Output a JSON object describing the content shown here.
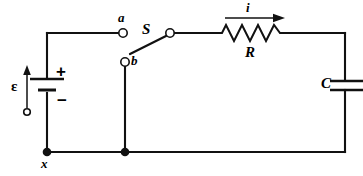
{
  "diagram": {
    "type": "schematic",
    "stroke_color": "#111111",
    "background_color": "#ffffff"
  },
  "labels": {
    "emf": "ε",
    "battery_positive": "+",
    "battery_negative": "−",
    "switch": "S",
    "terminal_a": "a",
    "terminal_b": "b",
    "resistor": "R",
    "current": "i",
    "capacitor": "C",
    "node_x": "x"
  },
  "components": [
    {
      "name": "battery",
      "symbol": "emf-source",
      "label": "ε",
      "polarity_top": "+",
      "polarity_bottom": "−",
      "position": {
        "x": 47,
        "y": 85
      }
    },
    {
      "name": "switch",
      "symbol": "spdt-switch",
      "label": "S",
      "state": "open",
      "terminals": [
        "a",
        "b"
      ],
      "position": {
        "x": 146,
        "y": 33
      }
    },
    {
      "name": "resistor",
      "symbol": "zigzag-resistor",
      "label": "R",
      "zigzag_peaks": 4,
      "position": {
        "x": 252,
        "y": 37
      }
    },
    {
      "name": "capacitor",
      "symbol": "parallel-plate-capacitor",
      "label": "C",
      "position": {
        "x": 345,
        "y": 85
      }
    }
  ],
  "annotations": [
    {
      "name": "current-arrow",
      "label": "i",
      "direction": "right",
      "position": {
        "x": 252,
        "y": 18
      }
    },
    {
      "name": "emf-arrow",
      "label": "ε",
      "direction": "up",
      "position": {
        "x": 27,
        "y": 88
      }
    }
  ],
  "nodes": [
    {
      "name": "node-x",
      "label": "x",
      "x": 47,
      "y": 152,
      "filled": true
    },
    {
      "name": "node-b-branch",
      "label": "",
      "x": 125,
      "y": 152,
      "filled": true
    }
  ],
  "terminals": [
    {
      "name": "terminal-a",
      "label": "a",
      "x": 123,
      "y": 33,
      "filled": false
    },
    {
      "name": "terminal-b",
      "label": "b",
      "x": 125,
      "y": 62,
      "filled": false
    },
    {
      "name": "terminal-pivot",
      "label": "",
      "x": 170,
      "y": 33,
      "filled": false
    },
    {
      "name": "terminal-emf-ref",
      "label": "",
      "x": 27,
      "y": 110,
      "filled": false
    }
  ]
}
